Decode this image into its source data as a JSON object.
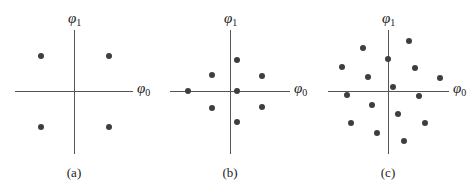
{
  "figure": {
    "axis_labels": {
      "horizontal_symbol": "φ",
      "horizontal_sub": "0",
      "vertical_symbol": "φ",
      "vertical_sub": "1"
    },
    "colors": {
      "dot": "#3e3e3e",
      "axis": "#555555"
    },
    "panels": [
      {
        "caption": "(a)",
        "origin": [
          74,
          91
        ],
        "h_axis": [
          15,
          133
        ],
        "v_axis": [
          30,
          154
        ],
        "points": [
          [
            41,
            56
          ],
          [
            109,
            56
          ],
          [
            41,
            127
          ],
          [
            109,
            127
          ]
        ]
      },
      {
        "caption": "(b)",
        "origin": [
          230,
          91
        ],
        "h_axis": [
          170,
          290
        ],
        "v_axis": [
          30,
          154
        ],
        "points": [
          [
            237,
            60
          ],
          [
            212,
            75
          ],
          [
            262,
            76
          ],
          [
            188,
            91
          ],
          [
            237,
            91
          ],
          [
            212,
            108
          ],
          [
            262,
            107
          ],
          [
            237,
            122
          ]
        ]
      },
      {
        "caption": "(c)",
        "origin": [
          388,
          91
        ],
        "h_axis": [
          328,
          449
        ],
        "v_axis": [
          30,
          154
        ],
        "points": [
          [
            409,
            41
          ],
          [
            363,
            48
          ],
          [
            388,
            59
          ],
          [
            342,
            67
          ],
          [
            415,
            68
          ],
          [
            368,
            77
          ],
          [
            440,
            78
          ],
          [
            393,
            87
          ],
          [
            347,
            95
          ],
          [
            419,
            96
          ],
          [
            372,
            105
          ],
          [
            398,
            114
          ],
          [
            351,
            123
          ],
          [
            425,
            123
          ],
          [
            377,
            133
          ],
          [
            404,
            141
          ]
        ]
      }
    ]
  }
}
